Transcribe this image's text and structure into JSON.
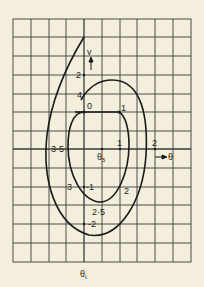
{
  "diagram": {
    "type": "phase-plane",
    "axes": {
      "horizontal_label": "θ",
      "vertical_label": "v",
      "bottom_label": "θt",
      "bottom_label_main": "θ",
      "bottom_label_sub": "t",
      "center_label_main": "θ",
      "center_label_sub": "5"
    },
    "grid": {
      "columns": 10,
      "rows": 13
    },
    "points": {
      "origin": "0",
      "p1": "1",
      "p1_lower": "1",
      "p2": "2",
      "p2_right": "2",
      "p2_top": "2",
      "p25": "2·5",
      "p3": "3",
      "p35": "3·5",
      "p4": "4",
      "neg1": "-1",
      "neg2": "-2"
    },
    "colors": {
      "background": "#f4efdc",
      "ink": "#222222"
    }
  }
}
